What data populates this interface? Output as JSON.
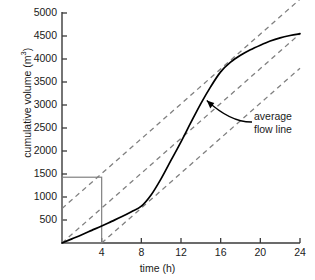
{
  "chart_data": {
    "type": "line",
    "title": "",
    "xlabel": "time (h)",
    "ylabel": "cumulative volume (m3)",
    "ylabel_text": "cumulative volume (m",
    "ylabel_sup": "3",
    "ylabel_suffix": ")",
    "xlim": [
      0,
      24
    ],
    "ylim": [
      0,
      5000
    ],
    "grid": false,
    "legend": "none",
    "x_ticks": [
      4,
      8,
      12,
      16,
      20,
      24
    ],
    "x_tick_labels": [
      "4",
      "8",
      "12",
      "16",
      "20",
      "24"
    ],
    "y_ticks": [
      500,
      1000,
      1500,
      2000,
      2500,
      3000,
      3500,
      4000,
      4500,
      5000
    ],
    "y_tick_labels": [
      "500",
      "1000",
      "1500",
      "2000",
      "2500",
      "3000",
      "3500",
      "4000",
      "4500",
      "5000"
    ],
    "series": [
      {
        "name": "cumulative volume curve",
        "style": "solid",
        "x": [
          0,
          1,
          2,
          3,
          4,
          5,
          6,
          7,
          8,
          9,
          10,
          11,
          12,
          13,
          14,
          15,
          16,
          17,
          18,
          19,
          20,
          21,
          22,
          23,
          24
        ],
        "y": [
          0,
          90,
          180,
          275,
          370,
          470,
          570,
          680,
          800,
          1050,
          1400,
          1800,
          2200,
          2620,
          3030,
          3400,
          3720,
          3930,
          4080,
          4200,
          4300,
          4390,
          4460,
          4510,
          4550
        ]
      },
      {
        "name": "average flow line (upper parallel)",
        "style": "dashed",
        "x": [
          0,
          24
        ],
        "y": [
          750,
          5300
        ]
      },
      {
        "name": "average flow line (middle, through origin)",
        "style": "dashed",
        "x": [
          0,
          24
        ],
        "y": [
          0,
          4550
        ]
      },
      {
        "name": "average flow line (lower parallel)",
        "style": "dashed",
        "x": [
          4,
          24
        ],
        "y": [
          0,
          3800
        ]
      }
    ],
    "construction_box": {
      "name": "construction rectangle",
      "x_from": 0,
      "x_to": 4,
      "y_from": 0,
      "y_to": 1430
    },
    "annotations": [
      {
        "name": "average-flow-line-callout",
        "line1": "average",
        "line2": "flow line",
        "points_to_x": 14.6,
        "points_to_y": 3100
      }
    ],
    "colors": {
      "axis": "#3a3a3a",
      "curve": "#000000",
      "dashed": "#808080",
      "box": "#808080",
      "text": "#1a1a1a",
      "background": "#ffffff"
    }
  }
}
